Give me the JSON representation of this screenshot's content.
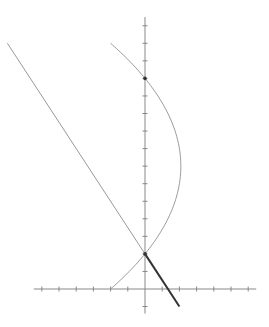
{
  "diagram": {
    "type": "coordinate-plot",
    "colors": {
      "background": "#ffffff",
      "axis": "#888888",
      "curve": "#999999",
      "line": "#999999",
      "segment": "#333333",
      "point": "#333333"
    },
    "axes": {
      "origin_px": [
        145,
        289
      ],
      "unit_x_px": 17.2,
      "unit_y_px": 17.55,
      "x_range": [
        -6,
        6
      ],
      "y_range": [
        -1.4,
        15.5
      ],
      "x_ticks": [
        -6,
        -5,
        -4,
        -3,
        -2,
        -1,
        1,
        2,
        3,
        4,
        5,
        6
      ],
      "y_ticks": [
        -1,
        1,
        2,
        3,
        4,
        5,
        6,
        7,
        8,
        9,
        10,
        11,
        12,
        13,
        14,
        15
      ]
    },
    "parabola": {
      "equation": "x = 25/12 - (y - 7)^2 / 12",
      "vertex": [
        2.083,
        7
      ],
      "y_from": 0,
      "y_to": 14
    },
    "line": {
      "equation": "y = 2 - 1.5x",
      "from": [
        -8,
        14
      ],
      "to": [
        0,
        2
      ]
    },
    "segment": {
      "from": [
        0,
        2
      ],
      "to": [
        2,
        -1
      ]
    },
    "points": [
      {
        "label": "A",
        "x": 0,
        "y": 2
      },
      {
        "label": "B",
        "x": 0,
        "y": 12
      }
    ]
  }
}
